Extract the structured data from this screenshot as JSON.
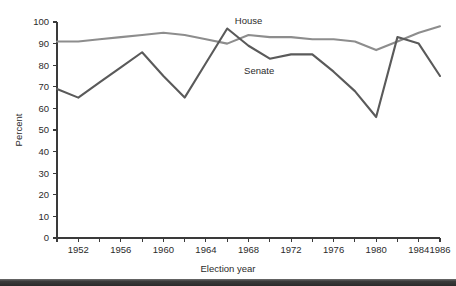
{
  "figure": {
    "background_color": "#ffffff",
    "bottom_bar_color": "#2f2f2f"
  },
  "axes": {
    "y_axis_title": "Percent",
    "x_axis_title": "Election year",
    "y_tick_labels": [
      "0",
      "10",
      "20",
      "30",
      "40",
      "50",
      "60",
      "70",
      "80",
      "90",
      "100"
    ],
    "x_tick_labels": [
      "1952",
      "1956",
      "1960",
      "1964",
      "1968",
      "1972",
      "1976",
      "1980",
      "1984",
      "1986"
    ]
  },
  "series_labels": {
    "house": "House",
    "senate": "Senate"
  },
  "chart_data": {
    "type": "line",
    "title": "",
    "xlabel": "Election year",
    "ylabel": "Percent",
    "xlim": [
      1950,
      1986
    ],
    "ylim": [
      0,
      100
    ],
    "grid": false,
    "legend": "inline-annotations",
    "x": [
      1950,
      1952,
      1954,
      1956,
      1958,
      1960,
      1962,
      1964,
      1966,
      1968,
      1970,
      1972,
      1974,
      1976,
      1978,
      1980,
      1982,
      1984,
      1986
    ],
    "x_tick_values": [
      1952,
      1956,
      1960,
      1964,
      1968,
      1972,
      1976,
      1980,
      1984,
      1986
    ],
    "y_tick_values": [
      0,
      10,
      20,
      30,
      40,
      50,
      60,
      70,
      80,
      90,
      100
    ],
    "series": [
      {
        "name": "House",
        "color": "#8d8d8d",
        "label_position": {
          "x": 1968,
          "y": 99
        },
        "values": [
          91,
          91,
          92,
          93,
          94,
          95,
          94,
          92,
          90,
          94,
          93,
          93,
          92,
          92,
          91,
          87,
          91,
          95,
          98
        ]
      },
      {
        "name": "Senate",
        "color": "#5a5a5a",
        "label_position": {
          "x": 1969,
          "y": 76
        },
        "values": [
          69,
          65,
          72,
          79,
          86,
          75,
          65,
          81,
          97,
          89,
          83,
          85,
          85,
          77,
          68,
          56,
          93,
          90,
          75
        ]
      }
    ]
  }
}
